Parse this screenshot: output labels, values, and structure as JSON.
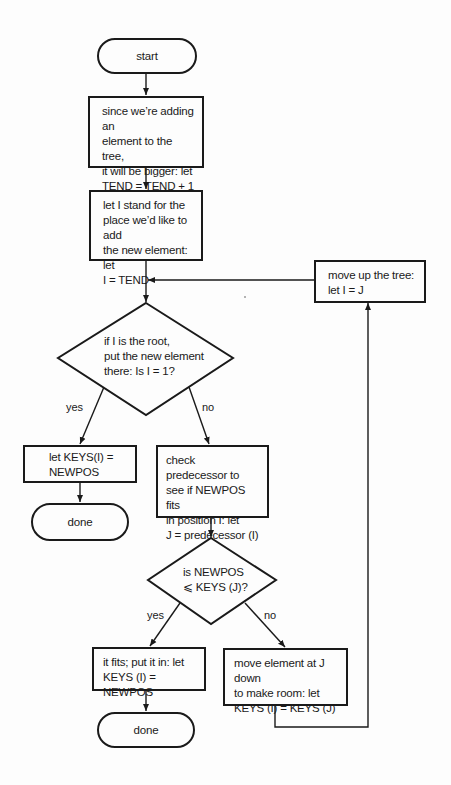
{
  "flowchart": {
    "start": "start",
    "increment_box": [
      "since we’re adding an",
      "element to the tree,",
      "it will be bigger: let",
      "TEND = TEND + 1"
    ],
    "set_i_box": [
      "let I stand for the",
      "place we’d like to add",
      "the new element: let",
      "I = TEND"
    ],
    "root_decision": [
      "if I is the root,",
      "put the new element",
      "there: Is I = 1?"
    ],
    "root_yes_label": "yes",
    "root_no_label": "no",
    "set_root_box": [
      "let KEYS(I) =",
      "NEWPOS"
    ],
    "done_1": "done",
    "check_pred_box": [
      "check predecessor to",
      "see if NEWPOS fits",
      "in position I: let",
      "J = predecessor (I)"
    ],
    "fit_decision": [
      "is NEWPOS",
      "⩽ KEYS (J)?"
    ],
    "fit_yes_label": "yes",
    "fit_no_label": "no",
    "fits_box": [
      "it fits; put it in: let",
      "KEYS (I) = NEWPOS"
    ],
    "done_2": "done",
    "move_down_box": [
      "move element at J down",
      "to make room: let",
      "KEYS (I) = KEYS (J)"
    ],
    "move_up_box": [
      "move up the tree:",
      "let I = J"
    ]
  }
}
